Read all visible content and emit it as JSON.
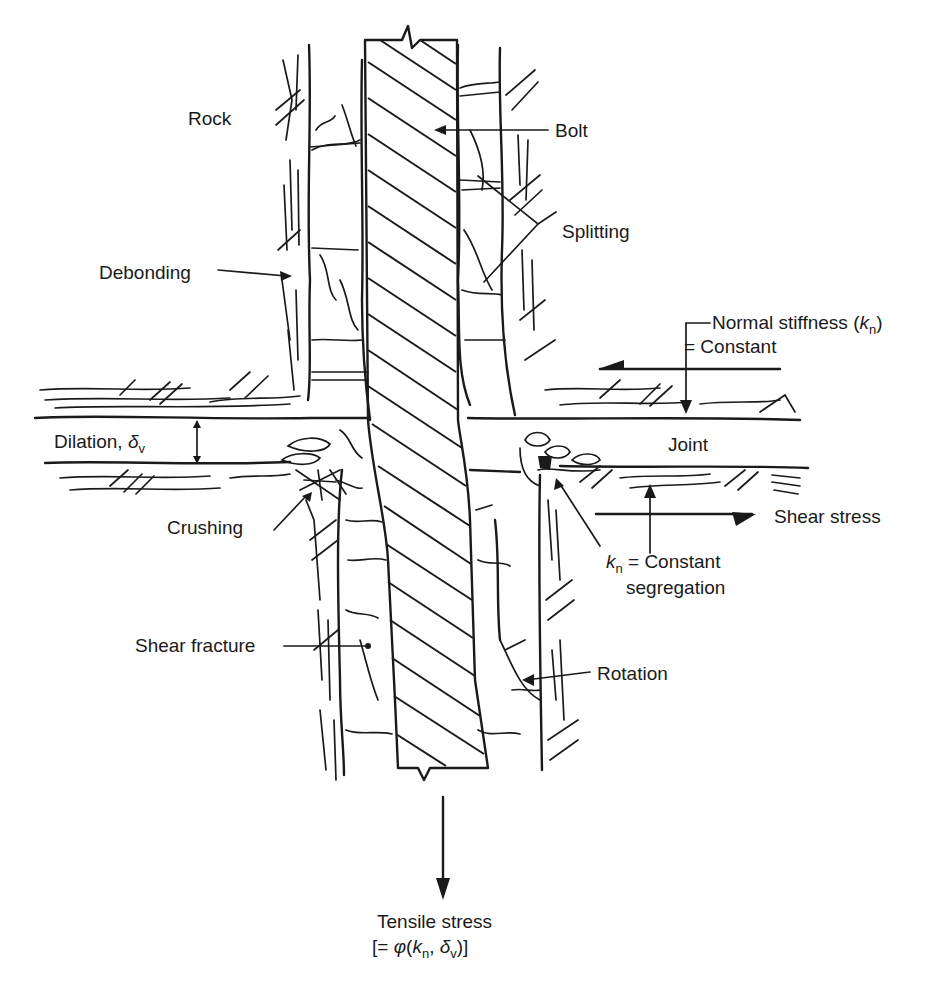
{
  "figure": {
    "type": "rock bolt behaviour at sheared joint",
    "ink_color": "#1a1a1a",
    "background": "#ffffff"
  },
  "labels": {
    "rock": "Rock",
    "bolt": "Bolt",
    "splitting": "Splitting",
    "debonding": "Debonding",
    "normal_stiffness_line1": "Normal stiffness (",
    "normal_stiffness_k": "k",
    "normal_stiffness_sub": "n",
    "normal_stiffness_close": ")",
    "normal_stiffness_line2": "= Constant",
    "dilation": "Dilation, ",
    "dilation_symbol": "δ",
    "dilation_sub": "v",
    "joint": "Joint",
    "crushing": "Crushing",
    "shear_stress": "Shear stress",
    "kn_k": "k",
    "kn_sub": "n",
    "kn_rest": " = Constant",
    "segregation": "segregation",
    "shear_fracture": "Shear fracture",
    "rotation": "Rotation",
    "tensile_line1": "Tensile stress",
    "tensile_open": "[= ",
    "tensile_phi": "φ",
    "tensile_paren_open": "(",
    "tensile_k": "k",
    "tensile_k_sub": "n",
    "tensile_comma": ", ",
    "tensile_delta": "δ",
    "tensile_delta_sub": "v",
    "tensile_close": ")]"
  }
}
